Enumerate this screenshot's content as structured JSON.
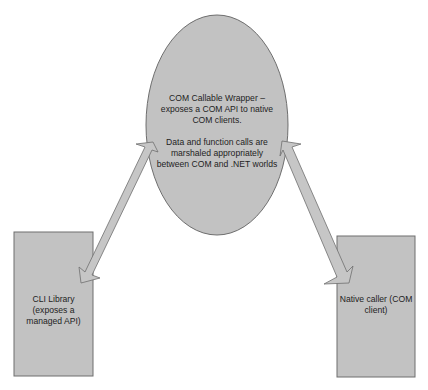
{
  "colors": {
    "shape_fill": "#c2c2c2",
    "shape_stroke": "#6e6e6e",
    "text": "#222222",
    "background": "#ffffff"
  },
  "nodes": {
    "ccw": {
      "shape": "ellipse",
      "line1": "COM Callable Wrapper –",
      "line2": "exposes a COM API to native",
      "line3": "COM clients.",
      "line4": "Data and function calls are",
      "line5": "marshaled appropriately",
      "line6": "between COM and .NET worlds"
    },
    "cli_library": {
      "shape": "rectangle",
      "line1": "CLI Library",
      "line2": "(exposes a",
      "line3": "managed API)"
    },
    "native_caller": {
      "shape": "rectangle",
      "line1": "Native caller (COM",
      "line2": "client)"
    }
  },
  "edges": [
    {
      "from": "cli_library",
      "to": "ccw",
      "type": "bidirectional-arrow"
    },
    {
      "from": "ccw",
      "to": "native_caller",
      "type": "bidirectional-arrow"
    }
  ]
}
